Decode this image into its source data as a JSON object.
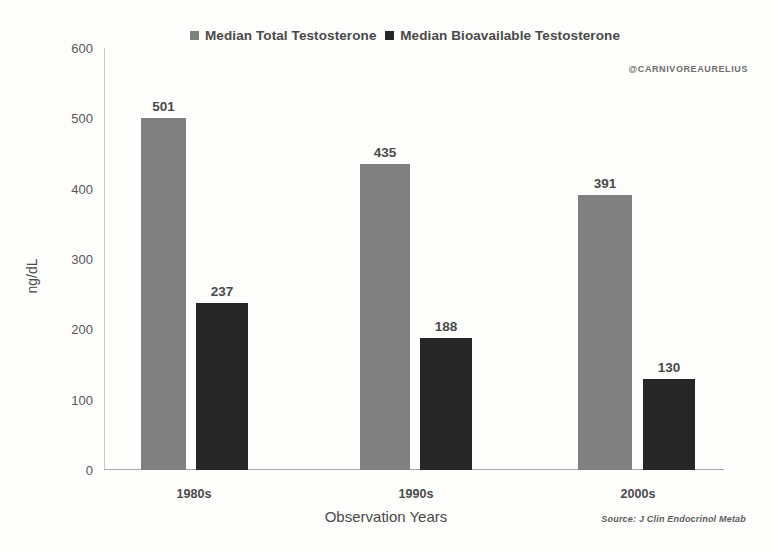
{
  "chart_data": {
    "type": "bar",
    "title": "",
    "subtitle": "",
    "xlabel": "Observation Years",
    "ylabel": "ng/dL",
    "categories": [
      "1980s",
      "1990s",
      "2000s"
    ],
    "series": [
      {
        "name": "Median Total Testosterone",
        "color": "#808080",
        "values": [
          501,
          435,
          391
        ]
      },
      {
        "name": "Median Bioavailable Testosterone",
        "color": "#262626",
        "values": [
          237,
          188,
          130
        ]
      }
    ],
    "ylim": [
      0,
      600
    ],
    "yticks": [
      0,
      100,
      200,
      300,
      400,
      500,
      600
    ],
    "ytick_labels": [
      "0",
      "100",
      "200",
      "300",
      "400",
      "500",
      "600"
    ],
    "grid": false,
    "legend_position": "top",
    "data_labels": true,
    "annotations": {
      "watermark": "@CARNIVOREAURELIUS",
      "source": "Source: J Clin Endocrinol Metab"
    }
  },
  "colors": {
    "background": "#fdfdfb",
    "series_total": "#808080",
    "series_bioavailable": "#262626",
    "axis": "#a8a8a8",
    "text": "#4a4a4a"
  }
}
